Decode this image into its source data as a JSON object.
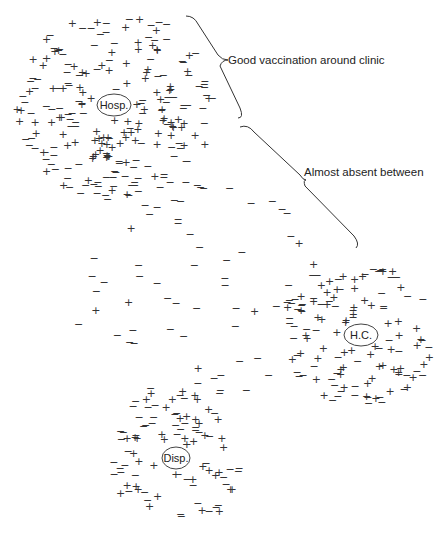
{
  "diagram": {
    "colors": {
      "ink": "#333333",
      "background": "#ffffff"
    },
    "facilities": [
      {
        "id": "hosp",
        "label": "Hosp.",
        "cx": 114,
        "cy": 105,
        "rx": 17,
        "ry": 11
      },
      {
        "id": "hc",
        "label": "H.C.",
        "cx": 361,
        "cy": 335,
        "rx": 17,
        "ry": 11
      },
      {
        "id": "disp",
        "label": "Disp.",
        "cx": 176,
        "cy": 458,
        "rx": 14,
        "ry": 11
      }
    ],
    "annotations": [
      {
        "id": "good",
        "text": "Good vaccination around clinic",
        "x": 228,
        "y": 60
      },
      {
        "id": "absent",
        "text": "Almost absent between",
        "x": 304,
        "y": 172
      }
    ],
    "legend_symbols": {
      "vaccinated": "+",
      "unvaccinated": "−"
    },
    "clusters": [
      {
        "id": "hosp",
        "cx": 114,
        "cy": 105,
        "rx": 100,
        "ry": 95,
        "count": 230,
        "plus_core": 0.9,
        "plus_edge": 0.25,
        "seed": 11
      },
      {
        "id": "hc",
        "cx": 361,
        "cy": 335,
        "rx": 80,
        "ry": 70,
        "count": 120,
        "plus_core": 0.9,
        "plus_edge": 0.3,
        "seed": 23
      },
      {
        "id": "disp",
        "cx": 176,
        "cy": 458,
        "rx": 65,
        "ry": 72,
        "count": 95,
        "plus_core": 0.9,
        "plus_edge": 0.3,
        "seed": 37
      },
      {
        "id": "between",
        "cx": 200,
        "cy": 290,
        "rx": 130,
        "ry": 110,
        "count": 70,
        "plus_core": 0.2,
        "plus_edge": 0.15,
        "seed": 53
      }
    ]
  }
}
